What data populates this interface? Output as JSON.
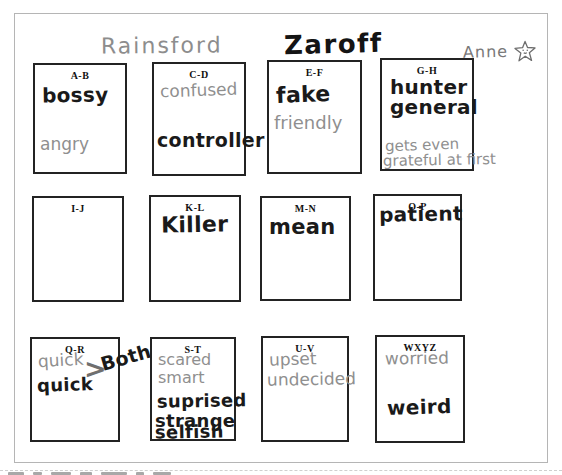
{
  "header": {
    "left_character": "Rainsford",
    "right_character": "Zaroff",
    "student_name": "Anne"
  },
  "icons": {
    "star_doodle": "hand-drawn star with smiley face"
  },
  "colors": {
    "marker_ink": "#1a1a1a",
    "pencil_ink": "#8f8f8f",
    "box_border": "#232323",
    "paper_border": "#b5b5b5"
  },
  "boxes": [
    {
      "label": "A-B",
      "entries": [
        {
          "text": "bossy",
          "ink": "marker"
        },
        {
          "text": "angry",
          "ink": "pencil"
        }
      ]
    },
    {
      "label": "C-D",
      "entries": [
        {
          "text": "confused",
          "ink": "pencil"
        },
        {
          "text": "controller",
          "ink": "marker"
        }
      ]
    },
    {
      "label": "E-F",
      "entries": [
        {
          "text": "fake",
          "ink": "marker"
        },
        {
          "text": "friendly",
          "ink": "pencil"
        }
      ]
    },
    {
      "label": "G-H",
      "entries": [
        {
          "text": "hunter",
          "ink": "marker"
        },
        {
          "text": "general",
          "ink": "marker"
        },
        {
          "text": "gets even",
          "ink": "pencil"
        },
        {
          "text": "grateful at first",
          "ink": "pencil"
        }
      ]
    },
    {
      "label": "I-J",
      "entries": []
    },
    {
      "label": "K-L",
      "entries": [
        {
          "text": "Killer",
          "ink": "marker"
        }
      ]
    },
    {
      "label": "M-N",
      "entries": [
        {
          "text": "mean",
          "ink": "marker"
        }
      ]
    },
    {
      "label": "O-P",
      "entries": [
        {
          "text": "patient",
          "ink": "marker"
        }
      ]
    },
    {
      "label": "Q-R",
      "entries": [
        {
          "text": "quick",
          "ink": "pencil"
        },
        {
          "text": "quick",
          "ink": "marker"
        },
        {
          "text": ">",
          "ink": "marker"
        },
        {
          "text": "Both!",
          "ink": "marker"
        }
      ]
    },
    {
      "label": "S-T",
      "entries": [
        {
          "text": "scared",
          "ink": "pencil"
        },
        {
          "text": "smart",
          "ink": "pencil"
        },
        {
          "text": "suprised",
          "ink": "marker"
        },
        {
          "text": "strange",
          "ink": "marker"
        },
        {
          "text": "selfish",
          "ink": "marker"
        }
      ]
    },
    {
      "label": "U-V",
      "entries": [
        {
          "text": "upset",
          "ink": "pencil"
        },
        {
          "text": "undecided",
          "ink": "pencil"
        }
      ]
    },
    {
      "label": "WXYZ",
      "entries": [
        {
          "text": "worried",
          "ink": "pencil"
        },
        {
          "text": "weird",
          "ink": "marker"
        }
      ]
    }
  ]
}
